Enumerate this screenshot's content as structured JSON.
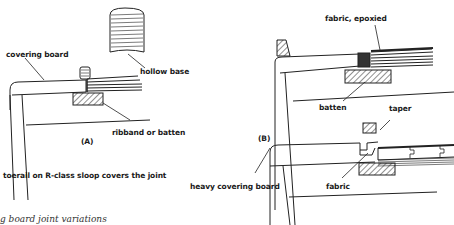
{
  "figure": {
    "panel_a": {
      "label": "(A)",
      "callouts": {
        "covering_board": "covering board",
        "hollow_base": "hollow base",
        "ribband": "ribband or batten"
      }
    },
    "panel_b": {
      "label": "(B)",
      "callouts": {
        "fabric_epoxied": "fabric, epoxied",
        "batten": "batten",
        "taper": "taper",
        "heavy_covering_board": "heavy covering board",
        "fabric": "fabric"
      }
    },
    "note": "toerail on R-class sloop covers the joint",
    "caption": "g board joint variations"
  }
}
